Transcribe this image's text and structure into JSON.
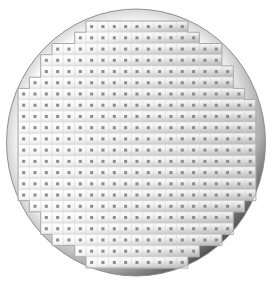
{
  "wafer": {
    "label": "Wafer map",
    "colors": {
      "edge_dark": "#4a4a4a",
      "edge_mid": "#9a9a9a",
      "surface_light": "#f7f7f7",
      "die_outline": "#d4d4d4",
      "die_marker": "#8c8c8c",
      "boundary_line": "#a8a8a8"
    },
    "grid": {
      "rows": 22,
      "columns": 21,
      "row_column_ranges": [
        [
          6,
          14
        ],
        [
          5,
          15
        ],
        [
          3,
          17
        ],
        [
          2,
          17
        ],
        [
          2,
          18
        ],
        [
          1,
          18
        ],
        [
          0,
          19
        ],
        [
          0,
          20
        ],
        [
          0,
          20
        ],
        [
          0,
          20
        ],
        [
          0,
          20
        ],
        [
          0,
          20
        ],
        [
          0,
          20
        ],
        [
          0,
          20
        ],
        [
          0,
          20
        ],
        [
          0,
          20
        ],
        [
          1,
          19
        ],
        [
          2,
          18
        ],
        [
          2,
          18
        ],
        [
          3,
          17
        ],
        [
          5,
          15
        ],
        [
          6,
          14
        ]
      ]
    },
    "die_marker_glyph": "×"
  }
}
